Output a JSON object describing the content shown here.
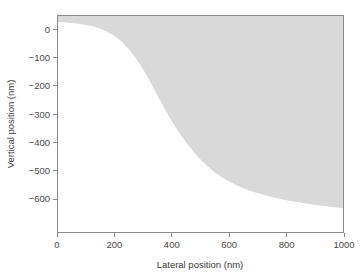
{
  "chart_data": {
    "type": "area",
    "title": "",
    "subtitle": "",
    "xlabel": "Lateral position (nm)",
    "ylabel": "Vertical position (nm)",
    "xlim": [
      0,
      1000
    ],
    "ylim": [
      -720,
      50
    ],
    "xticks": [
      0,
      200,
      400,
      600,
      800,
      1000
    ],
    "yticks": [
      0,
      -100,
      -200,
      -300,
      -400,
      -500,
      -600
    ],
    "xticklabels": [
      "0",
      "200",
      "400",
      "600",
      "800",
      "1000"
    ],
    "yticklabels": [
      "0",
      "-100",
      "-200",
      "-300",
      "-400",
      "-500",
      "-600"
    ],
    "grid": false,
    "legend": null,
    "legend_position": "none",
    "annotations": [],
    "fill_color": "#d9d9d9",
    "frame_color": "#8a8a8a",
    "series": [
      {
        "name": "surface profile",
        "description": "upper boundary of shaded region; region filled from this curve up to top of axes",
        "x": [
          0,
          25,
          50,
          75,
          100,
          125,
          150,
          175,
          200,
          225,
          250,
          275,
          300,
          325,
          350,
          375,
          400,
          425,
          450,
          475,
          500,
          525,
          550,
          575,
          600,
          625,
          650,
          675,
          700,
          725,
          750,
          775,
          800,
          825,
          850,
          875,
          900,
          925,
          950,
          975,
          1000
        ],
        "y": [
          25,
          24,
          22,
          19,
          15,
          10,
          2,
          -9,
          -24,
          -44,
          -70,
          -103,
          -142,
          -186,
          -234,
          -281,
          -325,
          -365,
          -400,
          -432,
          -460,
          -484,
          -505,
          -523,
          -538,
          -551,
          -562,
          -572,
          -580,
          -587,
          -593,
          -599,
          -604,
          -609,
          -613,
          -617,
          -621,
          -624,
          -627,
          -630,
          -633
        ]
      }
    ]
  },
  "axes": {
    "x_title": "Lateral position (nm)",
    "y_title": "Vertical position (nm)"
  }
}
